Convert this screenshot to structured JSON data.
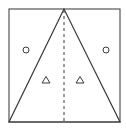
{
  "diagram": {
    "colors": {
      "background": "#ffffff",
      "stroke": "#3a3a3a",
      "outline": "#555555"
    },
    "square": {
      "x1": 9,
      "y1": 9,
      "x2": 120,
      "y2": 122
    },
    "triangle": {
      "apex": [
        64,
        9
      ],
      "left": [
        9,
        122
      ],
      "right": [
        120,
        122
      ]
    },
    "center_line": {
      "x": 64,
      "y1": 9,
      "y2": 122,
      "style": "dashed"
    },
    "markers": [
      {
        "shape": "circle",
        "region": "left-outer",
        "cx": 26,
        "cy": 50,
        "r": 3
      },
      {
        "shape": "circle",
        "region": "right-outer",
        "cx": 106,
        "cy": 50,
        "r": 3
      },
      {
        "shape": "triangle",
        "region": "left-inner",
        "cx": 46,
        "cy": 80,
        "size": 7
      },
      {
        "shape": "triangle",
        "region": "right-inner",
        "cx": 80,
        "cy": 80,
        "size": 7
      }
    ]
  }
}
